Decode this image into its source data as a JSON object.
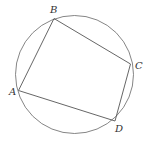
{
  "diagram": {
    "type": "cyclic-quadrilateral",
    "stroke_color": "#555555",
    "circle": {
      "cx": 74.5,
      "cy": 74.5,
      "r": 59
    },
    "vertices": [
      {
        "name": "A",
        "x": 18.5,
        "y": 90.5,
        "label_x": 9,
        "label_y": 95
      },
      {
        "name": "B",
        "x": 54,
        "y": 18.5,
        "label_x": 50,
        "label_y": 13
      },
      {
        "name": "C",
        "x": 130.5,
        "y": 64,
        "label_x": 135,
        "label_y": 69
      },
      {
        "name": "D",
        "x": 115,
        "y": 121,
        "label_x": 115,
        "label_y": 132
      }
    ],
    "edges": [
      [
        "A",
        "B"
      ],
      [
        "B",
        "C"
      ],
      [
        "C",
        "D"
      ],
      [
        "D",
        "A"
      ]
    ]
  },
  "labels": {
    "A": "A",
    "B": "B",
    "C": "C",
    "D": "D"
  }
}
